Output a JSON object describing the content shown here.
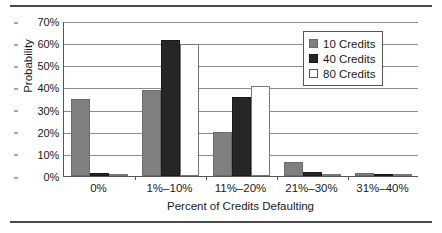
{
  "chart_data": {
    "type": "bar",
    "title": "",
    "xlabel": "Percent of Credits Defaulting",
    "ylabel": "Probability",
    "categories": [
      "0%",
      "1%–10%",
      "11%–20%",
      "21%–30%",
      "31%–40%"
    ],
    "series": [
      {
        "name": "10 Credits",
        "color": "#808080",
        "values": [
          34.8,
          38.9,
          20.0,
          6.2,
          1.5
        ]
      },
      {
        "name": "40 Credits",
        "color": "#262626",
        "values": [
          1.5,
          61.5,
          35.9,
          2.0,
          0.2
        ]
      },
      {
        "name": "80 Credits",
        "color": "#ffffff",
        "values": [
          0.1,
          59.5,
          40.8,
          0.7,
          0.0
        ]
      }
    ],
    "ylim": [
      0,
      70
    ],
    "yticks": [
      "0%",
      "10%",
      "20%",
      "30%",
      "40%",
      "50%",
      "60%",
      "70%"
    ],
    "ytick_values": [
      0,
      10,
      20,
      30,
      40,
      50,
      60,
      70
    ],
    "grid": "horizontal",
    "legend_position": "top-right"
  }
}
